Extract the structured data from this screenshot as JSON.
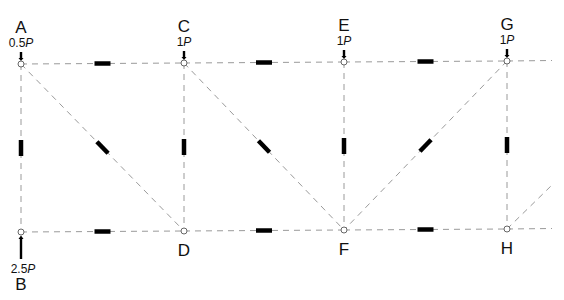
{
  "diagram": {
    "nodes": [
      {
        "id": "A",
        "label": "A",
        "row": "top",
        "col": 0
      },
      {
        "id": "C",
        "label": "C",
        "row": "top",
        "col": 1
      },
      {
        "id": "E",
        "label": "E",
        "row": "top",
        "col": 2
      },
      {
        "id": "G",
        "label": "G",
        "row": "top",
        "col": 3
      },
      {
        "id": "B",
        "label": "B",
        "row": "bottom",
        "col": 0
      },
      {
        "id": "D",
        "label": "D",
        "row": "bottom",
        "col": 1
      },
      {
        "id": "F",
        "label": "F",
        "row": "bottom",
        "col": 2
      },
      {
        "id": "H",
        "label": "H",
        "row": "bottom",
        "col": 3
      }
    ],
    "members": [
      {
        "from": "A",
        "to": "C",
        "kind": "top-chord"
      },
      {
        "from": "C",
        "to": "E",
        "kind": "top-chord"
      },
      {
        "from": "E",
        "to": "G",
        "kind": "top-chord"
      },
      {
        "from": "B",
        "to": "D",
        "kind": "bottom-chord"
      },
      {
        "from": "D",
        "to": "F",
        "kind": "bottom-chord"
      },
      {
        "from": "F",
        "to": "H",
        "kind": "bottom-chord"
      },
      {
        "from": "A",
        "to": "B",
        "kind": "vertical"
      },
      {
        "from": "C",
        "to": "D",
        "kind": "vertical"
      },
      {
        "from": "E",
        "to": "F",
        "kind": "vertical"
      },
      {
        "from": "G",
        "to": "H",
        "kind": "vertical"
      },
      {
        "from": "A",
        "to": "D",
        "kind": "diagonal"
      },
      {
        "from": "C",
        "to": "F",
        "kind": "diagonal"
      },
      {
        "from": "G",
        "to": "F",
        "kind": "diagonal"
      }
    ],
    "continuations": [
      "top-chord-beyond-G",
      "bottom-chord-beyond-H",
      "diagonal-beyond-H"
    ],
    "loads": [
      {
        "node": "A",
        "coef": "0.5",
        "unit": "P",
        "direction": "down"
      },
      {
        "node": "C",
        "coef": "1",
        "unit": "P",
        "direction": "down"
      },
      {
        "node": "E",
        "coef": "1",
        "unit": "P",
        "direction": "down"
      },
      {
        "node": "G",
        "coef": "1",
        "unit": "P",
        "direction": "down"
      }
    ],
    "reactions": [
      {
        "node": "B",
        "coef": "2.5",
        "unit": "P",
        "direction": "up"
      }
    ],
    "colors": {
      "member_line": "#9a9a9a",
      "member_marker": "#000000",
      "node_stroke": "#666666",
      "text": "#111111"
    }
  }
}
